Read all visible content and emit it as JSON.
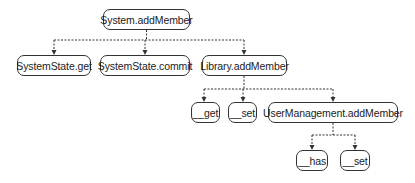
{
  "diagram": {
    "type": "call-tree",
    "nodes": [
      {
        "id": "root",
        "label": "System.addMember",
        "parent": null
      },
      {
        "id": "ssget",
        "label": "SystemState.get",
        "parent": "root"
      },
      {
        "id": "sscommit",
        "label": "SystemState.commit",
        "parent": "root"
      },
      {
        "id": "libadd",
        "label": "Library.addMember",
        "parent": "root"
      },
      {
        "id": "get",
        "label": "__get",
        "parent": "libadd"
      },
      {
        "id": "set1",
        "label": "__set",
        "parent": "libadd"
      },
      {
        "id": "umadd",
        "label": "UserManagement.addMember",
        "parent": "libadd"
      },
      {
        "id": "has",
        "label": "__has",
        "parent": "umadd"
      },
      {
        "id": "set2",
        "label": "__set",
        "parent": "umadd"
      }
    ],
    "edge_style": "dashed-arrow",
    "colors": {
      "stroke": "#333333",
      "background": "#ffffff",
      "text": "#222222"
    }
  }
}
